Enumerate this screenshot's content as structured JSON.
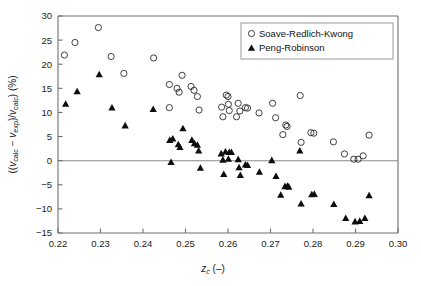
{
  "figure": {
    "title": "",
    "background": "#ffffff",
    "width": 421,
    "height": 286
  },
  "axes": {
    "x": {
      "label_main": "z",
      "label_sub": "c",
      "label_unit": " (–)",
      "label_full": "z_c (–)",
      "min": 0.22,
      "max": 0.3,
      "ticks": [
        "0.22",
        "0.23",
        "0.24",
        "0.25",
        "0.26",
        "0.27",
        "0.28",
        "0.29",
        "0.30"
      ],
      "tick_values": [
        0.22,
        0.23,
        0.24,
        0.25,
        0.26,
        0.27,
        0.28,
        0.29,
        0.3
      ]
    },
    "y": {
      "label_full": "((v_calc − v_exp)/v_calc) (%)",
      "label_p1": "((",
      "label_v1": "v",
      "label_s1": "calc",
      "label_p2": " − ",
      "label_v2": "v",
      "label_s2": "exp",
      "label_p3": ")/",
      "label_v3": "v",
      "label_s3": "calc",
      "label_p4": ") (%)",
      "min": -15,
      "max": 30,
      "ticks": [
        "30",
        "25",
        "20",
        "15",
        "10",
        "5",
        "0",
        "−5",
        "−10",
        "−15"
      ],
      "tick_values": [
        30,
        25,
        20,
        15,
        10,
        5,
        0,
        -5,
        -10,
        -15
      ]
    },
    "zero_line": 0,
    "grid": false,
    "frame_color": "#707070"
  },
  "legend": {
    "position": "top-right",
    "entries": [
      {
        "label": "Soave-Redlich-Kwong",
        "marker": "open-circle",
        "color": "#2b2b2b"
      },
      {
        "label": "Peng-Robinson",
        "marker": "filled-triangle",
        "color": "#0d0d0d"
      }
    ]
  },
  "chart_data": {
    "type": "scatter",
    "title": "",
    "xlabel": "z_c (–)",
    "ylabel": "((v_calc − v_exp)/v_calc) (%)",
    "xlim": [
      0.22,
      0.3
    ],
    "ylim": [
      -15,
      30
    ],
    "grid": false,
    "legend_position": "top-right",
    "series": [
      {
        "name": "Soave-Redlich-Kwong",
        "marker": "open-circle",
        "color": "#2b2b2b",
        "points": [
          [
            0.2215,
            21.9
          ],
          [
            0.224,
            24.5
          ],
          [
            0.2295,
            27.6
          ],
          [
            0.2325,
            21.6
          ],
          [
            0.2355,
            18.1
          ],
          [
            0.2425,
            21.3
          ],
          [
            0.2462,
            15.8
          ],
          [
            0.2462,
            11.0
          ],
          [
            0.248,
            15.0
          ],
          [
            0.2485,
            14.2
          ],
          [
            0.2492,
            17.7
          ],
          [
            0.2513,
            15.4
          ],
          [
            0.252,
            14.6
          ],
          [
            0.2528,
            13.3
          ],
          [
            0.2532,
            10.5
          ],
          [
            0.2585,
            11.1
          ],
          [
            0.2588,
            9.1
          ],
          [
            0.2596,
            13.6
          ],
          [
            0.26,
            13.3
          ],
          [
            0.2601,
            11.7
          ],
          [
            0.2603,
            10.4
          ],
          [
            0.262,
            9.1
          ],
          [
            0.2624,
            11.9
          ],
          [
            0.2628,
            10.3
          ],
          [
            0.2641,
            11.0
          ],
          [
            0.2646,
            10.9
          ],
          [
            0.2673,
            9.9
          ],
          [
            0.2705,
            11.9
          ],
          [
            0.2712,
            8.9
          ],
          [
            0.2729,
            5.4
          ],
          [
            0.2736,
            7.4
          ],
          [
            0.2739,
            7.1
          ],
          [
            0.277,
            13.5
          ],
          [
            0.2772,
            3.8
          ],
          [
            0.2795,
            5.8
          ],
          [
            0.2802,
            5.7
          ],
          [
            0.2848,
            3.9
          ],
          [
            0.2874,
            1.4
          ],
          [
            0.2896,
            0.3
          ],
          [
            0.2906,
            0.3
          ],
          [
            0.2918,
            1.0
          ],
          [
            0.2932,
            5.3
          ]
        ]
      },
      {
        "name": "Peng-Robinson",
        "marker": "filled-triangle",
        "color": "#0d0d0d",
        "points": [
          [
            0.2218,
            11.8
          ],
          [
            0.2245,
            14.4
          ],
          [
            0.2297,
            17.9
          ],
          [
            0.2327,
            11.0
          ],
          [
            0.2358,
            7.3
          ],
          [
            0.2424,
            10.7
          ],
          [
            0.2463,
            4.3
          ],
          [
            0.2466,
            -0.3
          ],
          [
            0.247,
            4.6
          ],
          [
            0.2483,
            3.4
          ],
          [
            0.2487,
            2.8
          ],
          [
            0.2494,
            6.7
          ],
          [
            0.2515,
            4.3
          ],
          [
            0.2521,
            3.6
          ],
          [
            0.2528,
            3.3
          ],
          [
            0.2531,
            2.1
          ],
          [
            0.2535,
            -1.5
          ],
          [
            0.2584,
            1.5
          ],
          [
            0.2588,
            0.2
          ],
          [
            0.259,
            -2.8
          ],
          [
            0.2594,
            1.9
          ],
          [
            0.2601,
            0.4
          ],
          [
            0.2603,
            1.8
          ],
          [
            0.2608,
            1.8
          ],
          [
            0.2624,
            0.3
          ],
          [
            0.2626,
            -1.4
          ],
          [
            0.2629,
            -3.0
          ],
          [
            0.2641,
            -0.8
          ],
          [
            0.2646,
            -0.9
          ],
          [
            0.2674,
            -2.3
          ],
          [
            0.2703,
            0.1
          ],
          [
            0.2713,
            -3.2
          ],
          [
            0.2724,
            -7.1
          ],
          [
            0.2734,
            -5.3
          ],
          [
            0.274,
            -5.2
          ],
          [
            0.2743,
            -5.4
          ],
          [
            0.2769,
            2.1
          ],
          [
            0.2772,
            -8.9
          ],
          [
            0.2797,
            -7.0
          ],
          [
            0.2803,
            -6.9
          ],
          [
            0.2849,
            -9.0
          ],
          [
            0.2877,
            -11.9
          ],
          [
            0.2899,
            -12.6
          ],
          [
            0.291,
            -12.5
          ],
          [
            0.2922,
            -11.9
          ],
          [
            0.2932,
            -7.2
          ]
        ]
      }
    ]
  }
}
